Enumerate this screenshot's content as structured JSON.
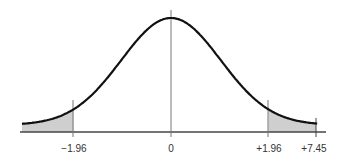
{
  "chart_data": {
    "type": "area",
    "title": "",
    "xlabel": "",
    "ylabel": "",
    "distribution": {
      "mean": 0,
      "sd": 1
    },
    "tick_labels": [
      "-1.96",
      "0",
      "+1.96",
      "+7.45"
    ],
    "tick_values": [
      -1.96,
      0,
      1.96,
      7.45
    ],
    "shaded_regions": [
      {
        "from": "left edge",
        "to": -1.96
      },
      {
        "from": 1.96,
        "to": 7.45
      }
    ],
    "marked_value": 7.45,
    "grid": false
  },
  "labels": {
    "neg": "−1.96",
    "zero": "0",
    "pos": "+1.96",
    "stat": "+7.45"
  },
  "colors": {
    "curve": "#111111",
    "shade": "#cfcfcf",
    "axis": "#444444"
  }
}
